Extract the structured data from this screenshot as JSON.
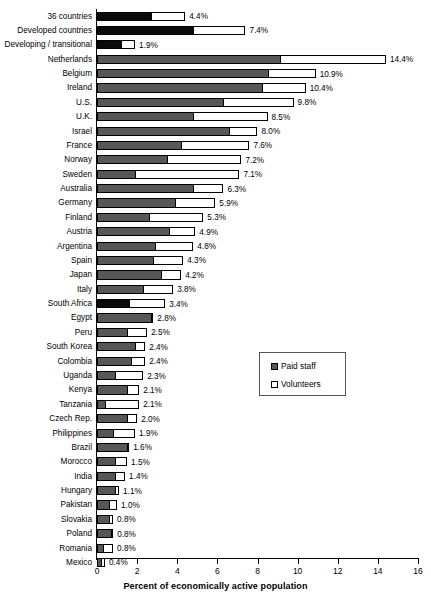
{
  "chart_data": {
    "type": "bar",
    "orientation": "horizontal",
    "stacked": true,
    "title": "",
    "xlabel": "Percent of economically active population",
    "ylabel": "",
    "xlim": [
      0,
      16
    ],
    "xticks": [
      0,
      2,
      4,
      6,
      8,
      10,
      12,
      14,
      16
    ],
    "grid": false,
    "legend": {
      "position": "center-right",
      "entries": [
        {
          "name": "Paid staff",
          "swatch": "paid",
          "color": "#575757"
        },
        {
          "name": "Volunteers",
          "swatch": "vol",
          "color": "#ffffff"
        }
      ]
    },
    "series": [
      {
        "name": "Paid staff",
        "color": "#575757"
      },
      {
        "name": "Volunteers",
        "color": "#ffffff"
      }
    ],
    "categories": [
      "36 countries",
      "Developed countries",
      "Developing / transitional",
      "Netherlands",
      "Belgium",
      "Ireland",
      "U.S.",
      "U.K.",
      "Israel",
      "France",
      "Norway",
      "Sweden",
      "Australia",
      "Germany",
      "Finland",
      "Austria",
      "Argentina",
      "Spain",
      "Japan",
      "Italy",
      "South Africa",
      "Egypt",
      "Peru",
      "South Korea",
      "Colombia",
      "Uganda",
      "Kenya",
      "Tanzania",
      "Czech Rep.",
      "Philippines",
      "Brazil",
      "Morocco",
      "India",
      "Hungary",
      "Pakistan",
      "Slovakia",
      "Poland",
      "Romania",
      "Mexico"
    ],
    "values": [
      4.4,
      7.4,
      1.9,
      14.4,
      10.9,
      10.4,
      9.8,
      8.5,
      8.0,
      7.6,
      7.2,
      7.1,
      6.3,
      5.9,
      5.3,
      4.9,
      4.8,
      4.3,
      4.2,
      3.8,
      3.4,
      2.8,
      2.5,
      2.4,
      2.4,
      2.3,
      2.1,
      2.1,
      2.0,
      1.9,
      1.6,
      1.5,
      1.4,
      1.1,
      1.0,
      0.8,
      0.8,
      0.8,
      0.4
    ],
    "rows": [
      {
        "label": "36 countries",
        "paid": 2.7,
        "volunteers": 1.7,
        "total": 4.4,
        "total_text": "4.4%",
        "style": "black"
      },
      {
        "label": "Developed countries",
        "paid": 4.8,
        "volunteers": 2.6,
        "total": 7.4,
        "total_text": "7.4%",
        "style": "black"
      },
      {
        "label": "Developing / transitional",
        "paid": 1.2,
        "volunteers": 0.7,
        "total": 1.9,
        "total_text": "1.9%",
        "style": "black"
      },
      {
        "label": "Netherlands",
        "paid": 9.1,
        "volunteers": 5.3,
        "total": 14.4,
        "total_text": "14.4%",
        "style": "gray"
      },
      {
        "label": "Belgium",
        "paid": 8.5,
        "volunteers": 2.4,
        "total": 10.9,
        "total_text": "10.9%",
        "style": "gray"
      },
      {
        "label": "Ireland",
        "paid": 8.2,
        "volunteers": 2.2,
        "total": 10.4,
        "total_text": "10.4%",
        "style": "gray"
      },
      {
        "label": "U.S.",
        "paid": 6.3,
        "volunteers": 3.5,
        "total": 9.8,
        "total_text": "9.8%",
        "style": "gray"
      },
      {
        "label": "U.K.",
        "paid": 4.8,
        "volunteers": 3.7,
        "total": 8.5,
        "total_text": "8.5%",
        "style": "gray"
      },
      {
        "label": "Israel",
        "paid": 6.6,
        "volunteers": 1.4,
        "total": 8.0,
        "total_text": "8.0%",
        "style": "gray"
      },
      {
        "label": "France",
        "paid": 4.2,
        "volunteers": 3.4,
        "total": 7.6,
        "total_text": "7.6%",
        "style": "gray"
      },
      {
        "label": "Norway",
        "paid": 3.5,
        "volunteers": 3.7,
        "total": 7.2,
        "total_text": "7.2%",
        "style": "gray"
      },
      {
        "label": "Sweden",
        "paid": 1.9,
        "volunteers": 5.2,
        "total": 7.1,
        "total_text": "7.1%",
        "style": "gray"
      },
      {
        "label": "Australia",
        "paid": 4.8,
        "volunteers": 1.5,
        "total": 6.3,
        "total_text": "6.3%",
        "style": "gray"
      },
      {
        "label": "Germany",
        "paid": 3.9,
        "volunteers": 2.0,
        "total": 5.9,
        "total_text": "5.9%",
        "style": "gray"
      },
      {
        "label": "Finland",
        "paid": 2.6,
        "volunteers": 2.7,
        "total": 5.3,
        "total_text": "5.3%",
        "style": "gray"
      },
      {
        "label": "Austria",
        "paid": 3.6,
        "volunteers": 1.3,
        "total": 4.9,
        "total_text": "4.9%",
        "style": "gray"
      },
      {
        "label": "Argentina",
        "paid": 2.9,
        "volunteers": 1.9,
        "total": 4.8,
        "total_text": "4.8%",
        "style": "gray"
      },
      {
        "label": "Spain",
        "paid": 2.8,
        "volunteers": 1.5,
        "total": 4.3,
        "total_text": "4.3%",
        "style": "gray"
      },
      {
        "label": "Japan",
        "paid": 3.2,
        "volunteers": 1.0,
        "total": 4.2,
        "total_text": "4.2%",
        "style": "gray"
      },
      {
        "label": "Italy",
        "paid": 2.3,
        "volunteers": 1.5,
        "total": 3.8,
        "total_text": "3.8%",
        "style": "gray"
      },
      {
        "label": "South Africa",
        "paid": 1.6,
        "volunteers": 1.8,
        "total": 3.4,
        "total_text": "3.4%",
        "style": "black"
      },
      {
        "label": "Egypt",
        "paid": 2.7,
        "volunteers": 0.1,
        "total": 2.8,
        "total_text": "2.8%",
        "style": "gray"
      },
      {
        "label": "Peru",
        "paid": 1.5,
        "volunteers": 1.0,
        "total": 2.5,
        "total_text": "2.5%",
        "style": "gray"
      },
      {
        "label": "South Korea",
        "paid": 1.9,
        "volunteers": 0.5,
        "total": 2.4,
        "total_text": "2.4%",
        "style": "gray"
      },
      {
        "label": "Colombia",
        "paid": 1.7,
        "volunteers": 0.7,
        "total": 2.4,
        "total_text": "2.4%",
        "style": "gray"
      },
      {
        "label": "Uganda",
        "paid": 0.9,
        "volunteers": 1.4,
        "total": 2.3,
        "total_text": "2.3%",
        "style": "gray"
      },
      {
        "label": "Kenya",
        "paid": 1.5,
        "volunteers": 0.6,
        "total": 2.1,
        "total_text": "2.1%",
        "style": "gray"
      },
      {
        "label": "Tanzania",
        "paid": 0.4,
        "volunteers": 1.7,
        "total": 2.1,
        "total_text": "2.1%",
        "style": "gray"
      },
      {
        "label": "Czech Rep.",
        "paid": 1.5,
        "volunteers": 0.5,
        "total": 2.0,
        "total_text": "2.0%",
        "style": "gray"
      },
      {
        "label": "Philippines",
        "paid": 0.8,
        "volunteers": 1.1,
        "total": 1.9,
        "total_text": "1.9%",
        "style": "gray"
      },
      {
        "label": "Brazil",
        "paid": 1.5,
        "volunteers": 0.1,
        "total": 1.6,
        "total_text": "1.6%",
        "style": "gray"
      },
      {
        "label": "Morocco",
        "paid": 0.9,
        "volunteers": 0.6,
        "total": 1.5,
        "total_text": "1.5%",
        "style": "gray"
      },
      {
        "label": "India",
        "paid": 0.9,
        "volunteers": 0.5,
        "total": 1.4,
        "total_text": "1.4%",
        "style": "gray"
      },
      {
        "label": "Hungary",
        "paid": 0.9,
        "volunteers": 0.2,
        "total": 1.1,
        "total_text": "1.1%",
        "style": "gray"
      },
      {
        "label": "Pakistan",
        "paid": 0.6,
        "volunteers": 0.4,
        "total": 1.0,
        "total_text": "1.0%",
        "style": "gray"
      },
      {
        "label": "Slovakia",
        "paid": 0.6,
        "volunteers": 0.2,
        "total": 0.8,
        "total_text": "0.8%",
        "style": "gray"
      },
      {
        "label": "Poland",
        "paid": 0.7,
        "volunteers": 0.1,
        "total": 0.8,
        "total_text": "0.8%",
        "style": "gray"
      },
      {
        "label": "Romania",
        "paid": 0.3,
        "volunteers": 0.5,
        "total": 0.8,
        "total_text": "0.8%",
        "style": "gray"
      },
      {
        "label": "Mexico",
        "paid": 0.2,
        "volunteers": 0.2,
        "total": 0.4,
        "total_text": "0.4%",
        "style": "gray"
      }
    ]
  },
  "axis": {
    "tick_labels": [
      "0",
      "2",
      "4",
      "6",
      "8",
      "10",
      "12",
      "14",
      "16"
    ],
    "title": "Percent of economically active population"
  },
  "legend": {
    "paid_label": "Paid staff",
    "volunteers_label": "Volunteers"
  }
}
